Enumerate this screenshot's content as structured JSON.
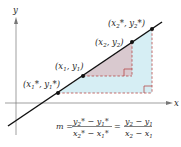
{
  "diagram": {
    "axes": {
      "x_label": "x",
      "y_label": "y"
    },
    "points": [
      {
        "id": "p1_star",
        "label": "(x1*, y1*)",
        "x": 58,
        "y": 93
      },
      {
        "id": "p1",
        "label": "(x1, y1)",
        "x": 83,
        "y": 76
      },
      {
        "id": "p2",
        "label": "(x2, y2)",
        "x": 132,
        "y": 42
      },
      {
        "id": "p2_star",
        "label": "(x2*, y2*)",
        "x": 152,
        "y": 29
      }
    ],
    "formula": "m = (y2* − y1*)/(x2* − x1*) = (y2 − y1)/(x2 − x1)",
    "formula_parts": {
      "m": "m =",
      "equals": "="
    },
    "colors": {
      "line": "#111111",
      "small_triangle_fill": "#d9c9cf",
      "large_triangle_fill": "#d6eef4",
      "dashed": "#b54a4a",
      "axis": "#777777"
    }
  }
}
